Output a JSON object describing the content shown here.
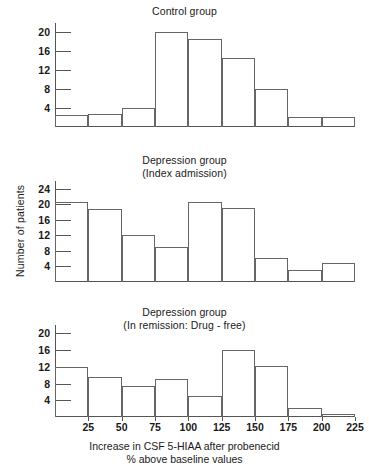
{
  "figure": {
    "xaxis": {
      "caption_line1": "Increase in CSF 5-HIAA after probenecid",
      "caption_line2": "% above baseline values",
      "ticks": [
        25,
        50,
        75,
        100,
        125,
        150,
        175,
        200,
        225
      ],
      "min": 0,
      "max": 225,
      "bin_width": 25
    },
    "yaxis_label": "Number of patients"
  },
  "chart_data": [
    {
      "type": "bar",
      "id": "control-group",
      "title": "Control group",
      "title_line2": "",
      "xlabel": "Increase in CSF 5-HIAA after probenecid % above baseline values",
      "ylabel": "Number of patients",
      "ylim": [
        0,
        22
      ],
      "yticks": [
        4,
        8,
        12,
        16,
        20
      ],
      "grid": false,
      "bin_edges": [
        0,
        25,
        50,
        75,
        100,
        125,
        150,
        175,
        200,
        225
      ],
      "categories": [
        "0-25",
        "25-50",
        "50-75",
        "75-100",
        "100-125",
        "125-150",
        "150-175",
        "175-200",
        "200-225"
      ],
      "values": [
        2.6,
        2.7,
        4.0,
        20.2,
        18.6,
        14.7,
        8.0,
        2.1,
        2.1
      ]
    },
    {
      "type": "bar",
      "id": "depression-index-admission",
      "title": "Depression group",
      "title_line2": "(Index admission)",
      "xlabel": "Increase in CSF 5-HIAA after probenecid % above baseline values",
      "ylabel": "Number of patients",
      "ylim": [
        0,
        26
      ],
      "yticks": [
        4,
        8,
        12,
        16,
        20,
        24
      ],
      "grid": false,
      "bin_edges": [
        0,
        25,
        50,
        75,
        100,
        125,
        150,
        175,
        200,
        225
      ],
      "categories": [
        "0-25",
        "25-50",
        "50-75",
        "75-100",
        "100-125",
        "125-150",
        "150-175",
        "175-200",
        "200-225"
      ],
      "values": [
        20.7,
        18.8,
        12.0,
        9.1,
        20.5,
        19.0,
        6.3,
        3.0,
        4.8
      ]
    },
    {
      "type": "bar",
      "id": "depression-in-remission",
      "title": "Depression group",
      "title_line2": "(In remission: Drug - free)",
      "xlabel": "Increase in CSF 5-HIAA after probenecid % above baseline values",
      "ylabel": "Number of patients",
      "ylim": [
        0,
        22
      ],
      "yticks": [
        4,
        8,
        12,
        16,
        20
      ],
      "grid": false,
      "bin_edges": [
        0,
        25,
        50,
        75,
        100,
        125,
        150,
        175,
        200,
        225
      ],
      "categories": [
        "0-25",
        "25-50",
        "50-75",
        "75-100",
        "100-125",
        "125-150",
        "150-175",
        "175-200",
        "200-225"
      ],
      "values": [
        12.0,
        9.6,
        7.4,
        9.2,
        5.0,
        16.0,
        12.1,
        2.1,
        0.8
      ]
    }
  ],
  "colors": {
    "background": "#ffffff",
    "axis": "#555555",
    "bar_stroke": "#666666",
    "text": "#1a1a1a"
  }
}
